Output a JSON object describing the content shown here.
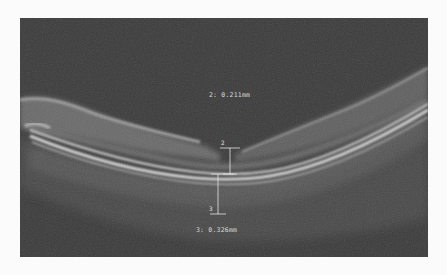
{
  "image": {
    "type": "OCT B-scan",
    "background_color": "#3a3a3a",
    "page_background": "#fbfbfb"
  },
  "measurements": [
    {
      "id": "2",
      "tag": "2",
      "label": "2: 0.211mm",
      "value": "0.211",
      "unit": "mm"
    },
    {
      "id": "3",
      "tag": "3",
      "label": "3: 0.326mm",
      "value": "0.326",
      "unit": "mm"
    }
  ]
}
